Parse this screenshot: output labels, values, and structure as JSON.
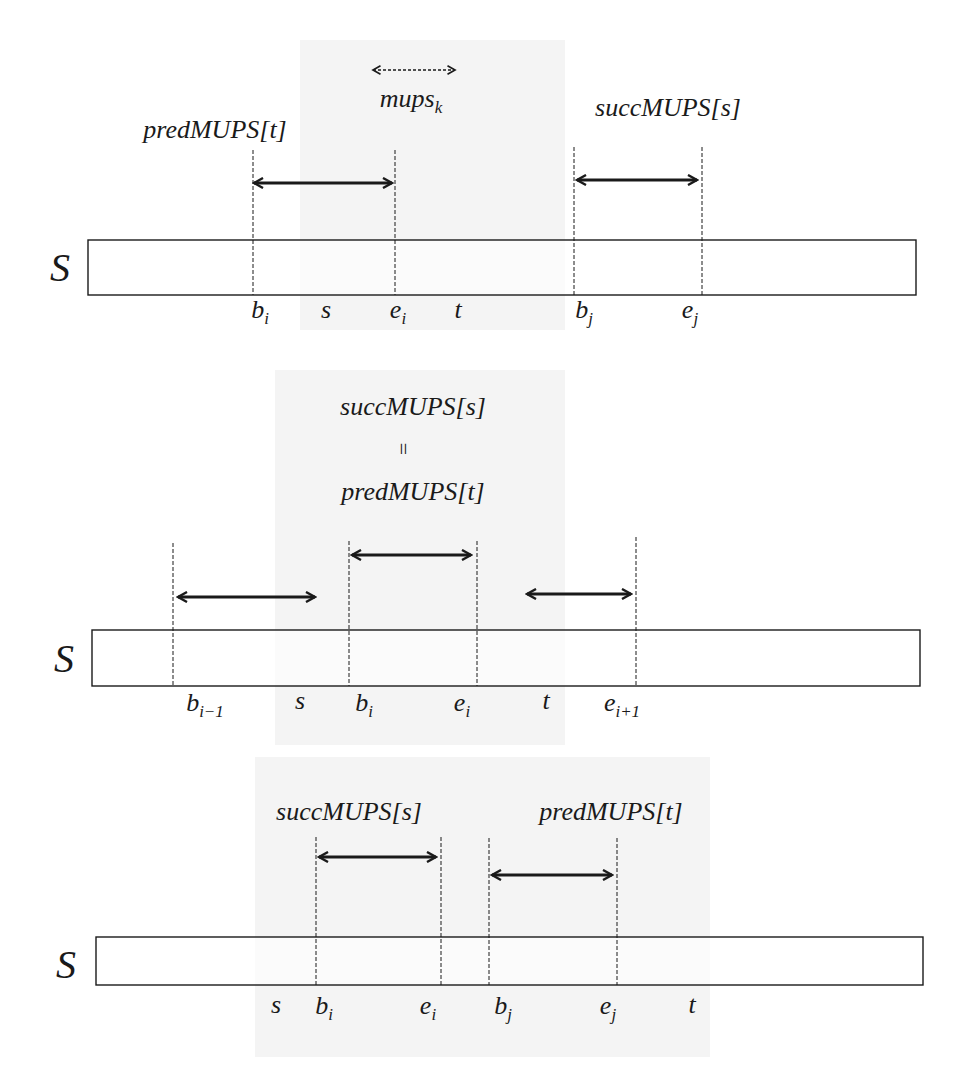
{
  "page": {
    "header_clipped": "",
    "string_label": "S"
  },
  "panels": [
    {
      "id": "panel-1",
      "bar": {
        "x1": 88,
        "x2": 916,
        "y1": 240,
        "y2": 295
      },
      "s_label": {
        "x": 60,
        "y": 268,
        "text": "S"
      },
      "dashed_lines": [
        {
          "x": 253,
          "y1": 150,
          "y2": 295
        },
        {
          "x": 395,
          "y1": 150,
          "y2": 295
        },
        {
          "x": 574,
          "y1": 147,
          "y2": 295
        },
        {
          "x": 702,
          "y1": 147,
          "y2": 295
        }
      ],
      "arrows": [
        {
          "x1": 251,
          "x2": 395,
          "y": 183,
          "style": "solid"
        },
        {
          "x1": 574,
          "x2": 700,
          "y": 180,
          "style": "solid"
        },
        {
          "x1": 371,
          "x2": 457,
          "y": 70,
          "style": "dashed"
        }
      ],
      "labels": [
        {
          "text": "predMUPS[t]",
          "x": 215,
          "y": 130
        },
        {
          "text": "mups",
          "sub": "k",
          "x": 411,
          "y": 101
        },
        {
          "text": "succMUPS[s]",
          "x": 668,
          "y": 108
        }
      ],
      "positions": [
        {
          "text": "b",
          "sub": "i",
          "x": 260,
          "y": 312
        },
        {
          "text": "s",
          "x": 326,
          "y": 310
        },
        {
          "text": "e",
          "sub": "i",
          "x": 398,
          "y": 312
        },
        {
          "text": "t",
          "x": 458,
          "y": 310
        },
        {
          "text": "b",
          "sub": "j",
          "x": 584,
          "y": 312
        },
        {
          "text": "e",
          "sub": "j",
          "x": 690,
          "y": 312
        }
      ]
    },
    {
      "id": "panel-2",
      "bar": {
        "x1": 92,
        "x2": 920,
        "y1": 630,
        "y2": 686
      },
      "s_label": {
        "x": 64,
        "y": 659,
        "text": "S"
      },
      "dashed_lines": [
        {
          "x": 173,
          "y1": 543,
          "y2": 686
        },
        {
          "x": 349,
          "y1": 541,
          "y2": 686
        },
        {
          "x": 477,
          "y1": 541,
          "y2": 686
        },
        {
          "x": 636,
          "y1": 537,
          "y2": 686
        }
      ],
      "arrows": [
        {
          "x1": 175,
          "x2": 318,
          "y": 597,
          "style": "solid"
        },
        {
          "x1": 349,
          "x2": 474,
          "y": 555,
          "style": "solid"
        },
        {
          "x1": 524,
          "x2": 634,
          "y": 594,
          "style": "solid"
        }
      ],
      "labels": [
        {
          "text": "succMUPS[s]",
          "x": 413,
          "y": 407
        },
        {
          "text": "predMUPS[t]",
          "x": 413,
          "y": 492
        }
      ],
      "equals": {
        "text": "=",
        "x": 403,
        "y": 449
      },
      "positions": [
        {
          "text": "b",
          "sub": "i−1",
          "x": 205,
          "y": 705
        },
        {
          "text": "s",
          "x": 300,
          "y": 701
        },
        {
          "text": "b",
          "sub": "i",
          "x": 364,
          "y": 705
        },
        {
          "text": "e",
          "sub": "i",
          "x": 462,
          "y": 705
        },
        {
          "text": "t",
          "x": 546,
          "y": 701
        },
        {
          "text": "e",
          "sub": "i+1",
          "x": 622,
          "y": 705
        }
      ]
    },
    {
      "id": "panel-3",
      "bar": {
        "x1": 96,
        "x2": 923,
        "y1": 937,
        "y2": 985
      },
      "s_label": {
        "x": 66,
        "y": 965,
        "text": "S"
      },
      "dashed_lines": [
        {
          "x": 316,
          "y1": 837,
          "y2": 985
        },
        {
          "x": 441,
          "y1": 837,
          "y2": 985
        },
        {
          "x": 489,
          "y1": 838,
          "y2": 985
        },
        {
          "x": 617,
          "y1": 838,
          "y2": 985
        }
      ],
      "arrows": [
        {
          "x1": 316,
          "x2": 439,
          "y": 857,
          "style": "solid"
        },
        {
          "x1": 489,
          "x2": 615,
          "y": 875,
          "style": "solid"
        }
      ],
      "labels": [
        {
          "text": "succMUPS[s]",
          "x": 349,
          "y": 812
        },
        {
          "text": "predMUPS[t]",
          "x": 611,
          "y": 812
        }
      ],
      "positions": [
        {
          "text": "s",
          "x": 276,
          "y": 1005
        },
        {
          "text": "b",
          "sub": "i",
          "x": 324,
          "y": 1008
        },
        {
          "text": "e",
          "sub": "i",
          "x": 428,
          "y": 1008
        },
        {
          "text": "b",
          "sub": "j",
          "x": 503,
          "y": 1008
        },
        {
          "text": "e",
          "sub": "j",
          "x": 608,
          "y": 1008
        },
        {
          "text": "t",
          "x": 692,
          "y": 1005
        }
      ]
    }
  ],
  "colors": {
    "ink": "#1a1a1a",
    "scan_band": "#f3f3f3",
    "background": "#ffffff"
  }
}
